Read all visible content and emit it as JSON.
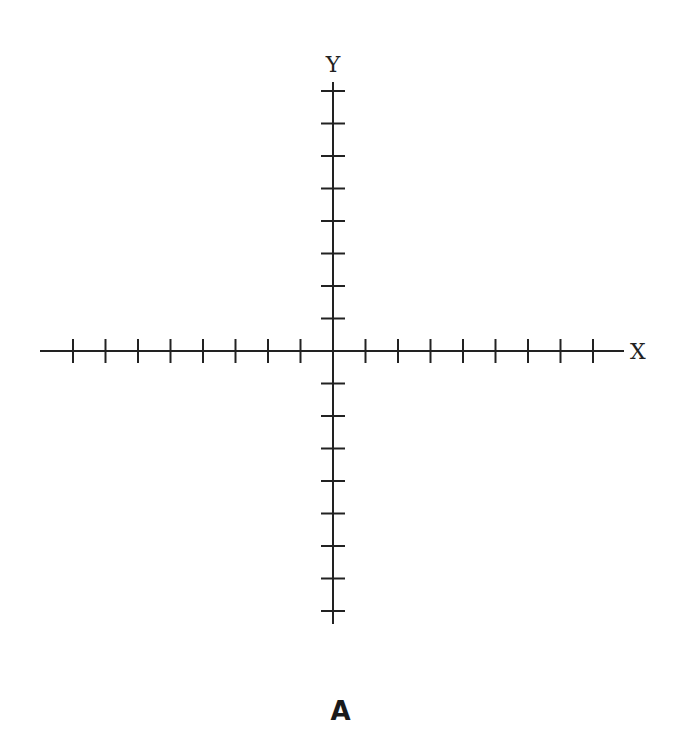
{
  "diagram": {
    "type": "cartesian-coordinate-plane",
    "x_axis_label": "X",
    "y_axis_label": "Y",
    "caption": "A",
    "origin": {
      "x": 333,
      "y": 351
    },
    "tick_spacing": 32.5,
    "x_ticks_left": 8,
    "x_ticks_right": 8,
    "y_ticks_up": 8,
    "y_ticks_down": 8,
    "x_axis_extent": [
      40,
      624
    ],
    "y_axis_extent": [
      82,
      624
    ],
    "line_color": "#222222"
  }
}
